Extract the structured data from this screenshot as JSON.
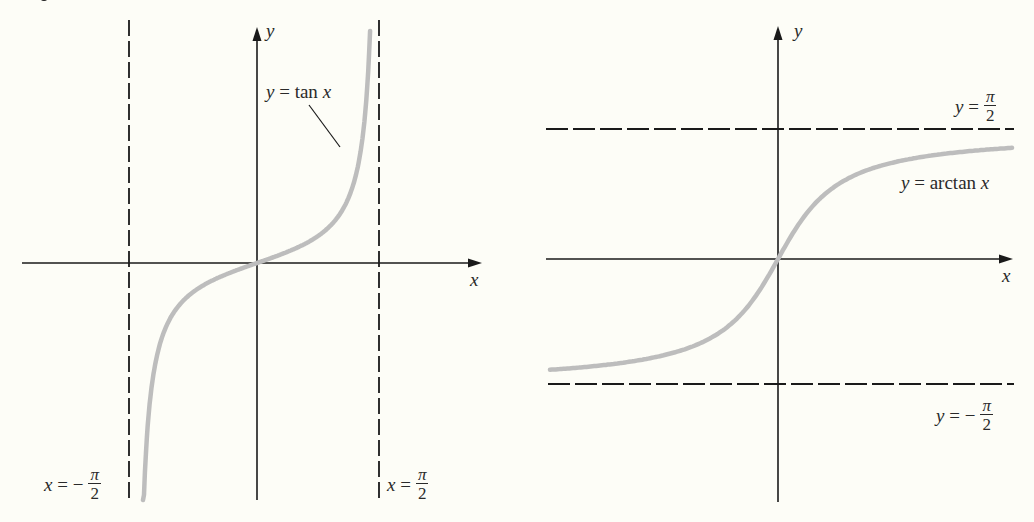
{
  "chart_data": [
    {
      "type": "line",
      "title": "",
      "function": "y = tan x",
      "curve_label": "y = tan x",
      "xlabel": "x",
      "ylabel": "y",
      "domain": "(-π/2, π/2)",
      "asymptotes": [
        {
          "orientation": "vertical",
          "value": "-π/2",
          "label_lhs": "x = −",
          "label_num": "π",
          "label_den": "2"
        },
        {
          "orientation": "vertical",
          "value": "π/2",
          "label_lhs": "x = ",
          "label_num": "π",
          "label_den": "2"
        }
      ],
      "passes_through": [
        [
          0,
          0
        ]
      ],
      "grid": false,
      "sample_points": [
        {
          "x": -1.45,
          "y": -8.24
        },
        {
          "x": -1.2,
          "y": -2.57
        },
        {
          "x": -0.8,
          "y": -1.03
        },
        {
          "x": -0.4,
          "y": -0.42
        },
        {
          "x": 0,
          "y": 0
        },
        {
          "x": 0.4,
          "y": 0.42
        },
        {
          "x": 0.8,
          "y": 1.03
        },
        {
          "x": 1.2,
          "y": 2.57
        },
        {
          "x": 1.45,
          "y": 8.24
        }
      ],
      "render": {
        "origin_px": [
          257,
          263
        ],
        "px_per_x": 77.7,
        "px_per_y": 27,
        "x_range": [
          -1.467,
          1.455
        ],
        "clip_y": [
          27,
          500
        ]
      }
    },
    {
      "type": "line",
      "title": "",
      "function": "y = arctan x",
      "curve_label": "y = arctan x",
      "xlabel": "x",
      "ylabel": "y",
      "range": "(-π/2, π/2)",
      "asymptotes": [
        {
          "orientation": "horizontal",
          "value": "π/2",
          "label_lhs": "y = ",
          "label_num": "π",
          "label_den": "2"
        },
        {
          "orientation": "horizontal",
          "value": "-π/2",
          "label_lhs": "y = −",
          "label_num": "π",
          "label_den": "2"
        }
      ],
      "passes_through": [
        [
          0,
          0
        ]
      ],
      "grid": false,
      "sample_points": [
        {
          "x": -5,
          "y": -1.37
        },
        {
          "x": -2,
          "y": -1.11
        },
        {
          "x": -1,
          "y": -0.785
        },
        {
          "x": 0,
          "y": 0
        },
        {
          "x": 1,
          "y": 0.785
        },
        {
          "x": 2,
          "y": 1.11
        },
        {
          "x": 5,
          "y": 1.37
        }
      ],
      "render": {
        "origin_px": [
          778,
          259
        ],
        "px_per_x": 45,
        "px_per_y": 80.5,
        "x_px_range": [
          550,
          1012
        ]
      }
    }
  ],
  "left": {
    "y_axis_label": "y",
    "x_axis_label": "x",
    "curve_label": {
      "lhs": "y",
      "rest": " = tan ",
      "var": "x"
    },
    "asym_left": {
      "lhs": "x",
      "eq": " = −",
      "num": "π",
      "den": "2"
    },
    "asym_right": {
      "lhs": "x",
      "eq": " = ",
      "num": "π",
      "den": "2"
    }
  },
  "right": {
    "y_axis_label": "y",
    "x_axis_label": "x",
    "curve_label": {
      "lhs": "y",
      "rest": " = arctan ",
      "var": "x"
    },
    "asym_top": {
      "lhs": "y",
      "eq": " = ",
      "num": "π",
      "den": "2"
    },
    "asym_bottom": {
      "lhs": "y",
      "eq": " = −",
      "num": "π",
      "den": "2"
    }
  }
}
